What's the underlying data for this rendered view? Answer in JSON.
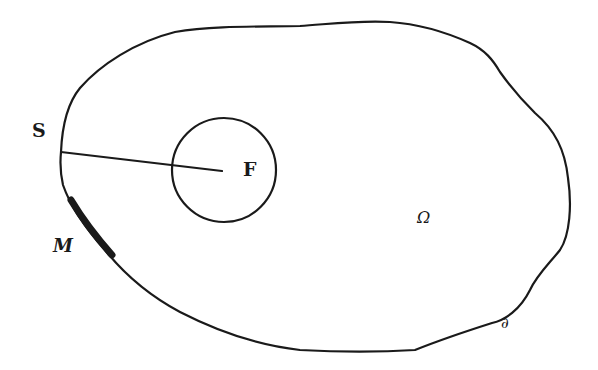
{
  "diagram": {
    "labels": {
      "source": "S",
      "focus": "F",
      "segment": "M",
      "domain": "Ω",
      "boundary": "∂"
    },
    "colors": {
      "stroke": "#1a1a1a",
      "background": "#ffffff"
    },
    "elements": {
      "domain_boundary": "closed irregular curve",
      "inner_circle": {
        "cx": 224,
        "cy": 170,
        "r": 52
      },
      "connector_line": {
        "from": [
          61,
          152
        ],
        "to": [
          222,
          171
        ]
      },
      "thick_segment": {
        "from": [
          71,
          200
        ],
        "to": [
          112,
          255
        ]
      }
    }
  }
}
